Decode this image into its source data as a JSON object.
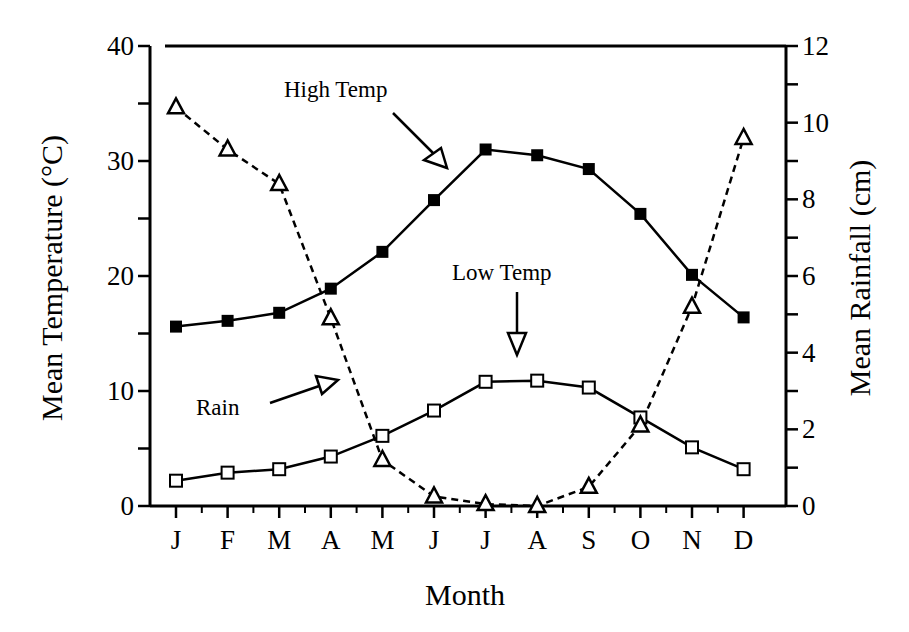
{
  "chart_data": {
    "type": "line",
    "title": "",
    "xlabel": "Month",
    "ylabel": "Mean Temperature (°C)",
    "y2label": "Mean Rainfall (cm)",
    "categories": [
      "J",
      "F",
      "M",
      "A",
      "M",
      "J",
      "J",
      "A",
      "S",
      "O",
      "N",
      "D"
    ],
    "ylim": [
      0,
      40
    ],
    "y2lim": [
      0,
      12
    ],
    "yticks": [
      "0",
      "10",
      "20",
      "30",
      "40"
    ],
    "y2ticks": [
      "0",
      "2",
      "4",
      "6",
      "8",
      "10",
      "12"
    ],
    "grid": false,
    "legend": "none (inline annotations with arrows)",
    "series": [
      {
        "name": "High Temp",
        "axis": "left",
        "marker": "filled-square",
        "line": "solid",
        "values": [
          15.6,
          16.1,
          16.8,
          18.9,
          22.1,
          26.6,
          31.0,
          30.5,
          29.3,
          25.4,
          20.1,
          16.4
        ]
      },
      {
        "name": "Low Temp",
        "axis": "left",
        "marker": "open-square",
        "line": "solid",
        "values": [
          2.2,
          2.9,
          3.2,
          4.3,
          6.1,
          8.3,
          10.8,
          10.9,
          10.3,
          7.7,
          5.1,
          3.2
        ]
      },
      {
        "name": "Rain",
        "axis": "right",
        "marker": "open-triangle",
        "line": "dashed",
        "values": [
          10.4,
          9.3,
          8.4,
          4.9,
          1.2,
          0.25,
          0.05,
          0.0,
          0.5,
          2.1,
          5.2,
          9.6
        ]
      }
    ],
    "annotations": [
      "High Temp",
      "Low Temp",
      "Rain"
    ]
  },
  "labels": {
    "ylabel": "Mean Temperature (°C)",
    "y2label": "Mean Rainfall (cm)",
    "xlabel": "Month",
    "high": "High Temp",
    "low": "Low Temp",
    "rain": "Rain"
  }
}
